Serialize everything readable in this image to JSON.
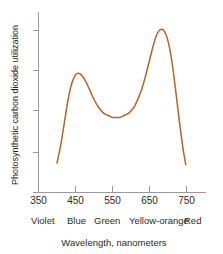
{
  "chart_data": {
    "type": "line",
    "title": "",
    "xlabel": "Wavelength, nanometers",
    "ylabel": "Photosynthetic carbon dioxide utilization",
    "xlim": [
      350,
      760
    ],
    "ylim": [
      0,
      100
    ],
    "grid": false,
    "legend": null,
    "line_color": "#b5642f",
    "axis_color": "#9a9a9a",
    "x_ticks": [
      "350",
      "450",
      "550",
      "650",
      "750"
    ],
    "x_tick_values": [
      350,
      450,
      550,
      650,
      750
    ],
    "y_ticks": [
      "",
      "",
      "",
      ""
    ],
    "y_tick_count": 4,
    "x": [
      400,
      410,
      420,
      430,
      440,
      450,
      460,
      470,
      480,
      490,
      500,
      510,
      520,
      530,
      540,
      550,
      560,
      570,
      580,
      590,
      600,
      610,
      620,
      630,
      640,
      650,
      660,
      670,
      680,
      690,
      700,
      710,
      720,
      730,
      740,
      748
    ],
    "y": [
      11,
      22,
      36,
      50,
      60,
      65,
      66,
      64,
      60,
      55,
      50,
      46,
      43,
      41,
      40,
      39,
      39,
      39,
      40,
      41,
      43,
      46,
      51,
      57,
      65,
      74,
      83,
      90,
      93,
      92,
      86,
      74,
      57,
      38,
      21,
      10
    ],
    "annotations": [
      {
        "label": "Violet",
        "x_range": [
          380,
          450
        ]
      },
      {
        "label": "Blue",
        "x_range": [
          450,
          495
        ]
      },
      {
        "label": "Green",
        "x_range": [
          495,
          570
        ]
      },
      {
        "label": "Yellow-orange",
        "x_range": [
          570,
          620
        ]
      },
      {
        "label": "Red",
        "x_range": [
          620,
          750
        ]
      }
    ],
    "series": [
      {
        "name": "Photosynthetic carbon dioxide utilization",
        "color": "#b5642f",
        "peaks": [
          {
            "wavelength": 460,
            "relative_utilization": 66
          },
          {
            "wavelength": 680,
            "relative_utilization": 93
          }
        ],
        "trough": {
          "wavelength": 565,
          "relative_utilization": 39
        }
      }
    ]
  },
  "axes": {
    "y_axis_label": "Photosynthetic carbon dioxide utilization",
    "x_axis_label": "Wavelength, nanometers",
    "x_tick_labels": [
      "350",
      "450",
      "550",
      "650",
      "750"
    ]
  },
  "color_bands": {
    "labels": [
      "Violet",
      "Blue",
      "Green",
      "Yellow-orange",
      "Red"
    ]
  },
  "colors": {
    "curve": "#b5642f",
    "axis": "#9a9a9a",
    "text": "#2b2b2b",
    "background": "#ffffff"
  }
}
